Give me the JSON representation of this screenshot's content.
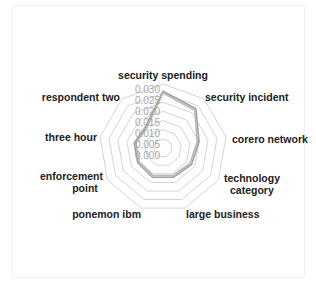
{
  "chart_data": {
    "type": "radar",
    "title": "",
    "categories": [
      "security spending",
      "security incident",
      "corero network",
      "technology category",
      "large business",
      "ponemon ibm",
      "enforcement point",
      "three hour",
      "respondent two"
    ],
    "series": [
      {
        "name": "Series 1",
        "color": "#a0a0a0",
        "values": [
          0.026,
          0.023,
          0.015,
          0.013,
          0.012,
          0.012,
          0.011,
          0.011,
          0.01
        ]
      },
      {
        "name": "Series 2",
        "color": "#b8b8b8",
        "values": [
          0.025,
          0.022,
          0.014,
          0.012,
          0.011,
          0.011,
          0.01,
          0.01,
          0.009
        ]
      }
    ],
    "radial_ticks": [
      "0.000",
      "0.005",
      "0.010",
      "0.015",
      "0.020",
      "0.025",
      "0.030"
    ],
    "rlim": [
      -0.005,
      0.03
    ],
    "grid": true,
    "legend": "none"
  },
  "labels": {
    "security_spending": "security spending",
    "security_incident": "security incident",
    "corero_network": "corero network",
    "technology_category_1": "technology",
    "technology_category_2": "category",
    "large_business": "large business",
    "ponemon_ibm": "ponemon ibm",
    "enforcement_point_1": "enforcement",
    "enforcement_point_2": "point",
    "three_hour": "three hour",
    "respondent_two": "respondent two"
  },
  "ticks": [
    "0.000",
    "0.005",
    "0.010",
    "0.015",
    "0.020",
    "0.025",
    "0.030"
  ]
}
